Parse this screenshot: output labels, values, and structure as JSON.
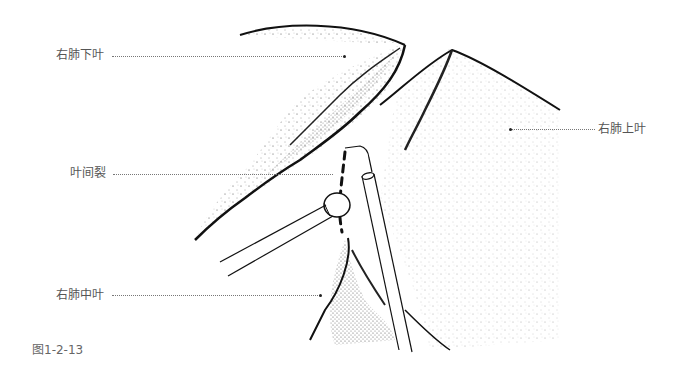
{
  "figure": {
    "caption": "图1-2-13",
    "labels": {
      "right_lower_lobe": "右肺下叶",
      "right_upper_lobe": "右肺上叶",
      "fissure": "叶间裂",
      "right_middle_lobe": "右肺中叶"
    },
    "illustration": "lung-fissure-dissection"
  }
}
